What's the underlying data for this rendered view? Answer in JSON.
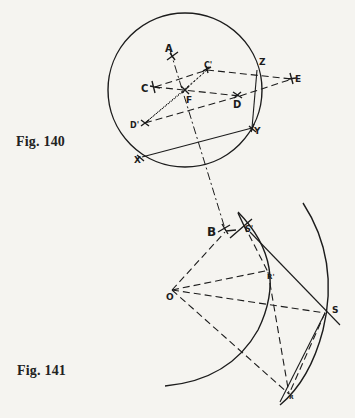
{
  "figures": [
    {
      "id": "fig140",
      "caption": "Fig. 140",
      "points": {
        "A": {
          "label": "A",
          "x": 172,
          "y": 57
        },
        "C": {
          "label": "C",
          "x": 153,
          "y": 87
        },
        "C_prime": {
          "label": "C'",
          "x": 207,
          "y": 70
        },
        "F": {
          "label": "F",
          "x": 185,
          "y": 90
        },
        "D": {
          "label": "D",
          "x": 237,
          "y": 95
        },
        "D_prime": {
          "label": "D'",
          "x": 145,
          "y": 123
        },
        "E": {
          "label": "E",
          "x": 292,
          "y": 78
        },
        "Z": {
          "label": "Z",
          "x": 257,
          "y": 70
        },
        "Y": {
          "label": "Y",
          "x": 252,
          "y": 128
        },
        "X": {
          "label": "X",
          "x": 140,
          "y": 158
        }
      },
      "circle": {
        "cx": 185,
        "cy": 90,
        "r": 77
      }
    },
    {
      "id": "fig141",
      "caption": "Fig. 141",
      "points": {
        "B": {
          "label": "B",
          "x": 225,
          "y": 229
        },
        "S_prime": {
          "label": "S'",
          "x": 242,
          "y": 225
        },
        "R_prime": {
          "label": "R'",
          "x": 268,
          "y": 270
        },
        "O": {
          "label": "O",
          "x": 172,
          "y": 290
        },
        "S": {
          "label": "S",
          "x": 325,
          "y": 312
        },
        "R": {
          "label": "R",
          "x": 290,
          "y": 394
        }
      }
    }
  ],
  "colors": {
    "ink": "#1c1c1c",
    "paper": "#f5f4f0"
  }
}
